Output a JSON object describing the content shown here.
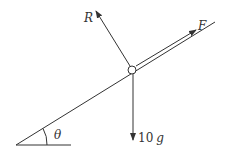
{
  "diagram": {
    "type": "inclined-plane-force-diagram",
    "labels": {
      "normal_reaction": "R",
      "applied_force": "F",
      "weight": "10",
      "weight_unit": "g",
      "angle": "θ"
    },
    "colors": {
      "line": "#333333",
      "background": "#ffffff"
    }
  }
}
